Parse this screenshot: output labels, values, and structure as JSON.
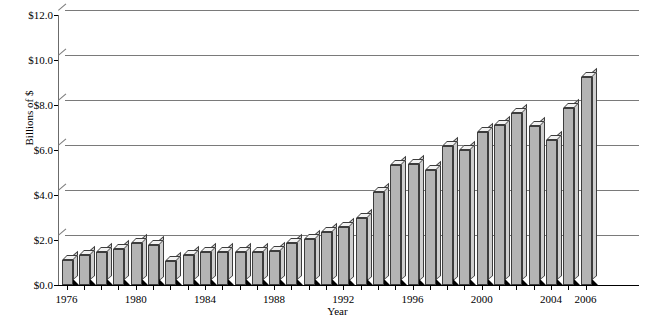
{
  "chart_data": {
    "type": "bar",
    "title": "",
    "xlabel": "Year",
    "ylabel": "Billions of $",
    "ylim": [
      0.0,
      12.0
    ],
    "ytick_step": 2.0,
    "ytick_labels": [
      "$0.0",
      "$2.0",
      "$4.0",
      "$6.0",
      "$8.0",
      "$10.0",
      "$12.0"
    ],
    "ytick_values": [
      0.0,
      2.0,
      4.0,
      6.0,
      8.0,
      10.0,
      12.0
    ],
    "grid": "horizontal",
    "legend": "none",
    "xtick_labels_shown": [
      "1976",
      "1980",
      "1984",
      "1988",
      "1992",
      "1996",
      "2000",
      "2004",
      "2006"
    ],
    "categories": [
      "1976",
      "1977",
      "1978",
      "1979",
      "1980",
      "1981",
      "1982",
      "1983",
      "1984",
      "1985",
      "1986",
      "1987",
      "1988",
      "1989",
      "1990",
      "1991",
      "1992",
      "1993",
      "1994",
      "1995",
      "1996",
      "1997",
      "1998",
      "1999",
      "2000",
      "2001",
      "2002",
      "2003",
      "2004",
      "2005",
      "2006"
    ],
    "values": [
      1.1,
      1.35,
      1.45,
      1.6,
      1.85,
      1.8,
      1.05,
      1.35,
      1.45,
      1.45,
      1.45,
      1.45,
      1.5,
      1.85,
      2.05,
      2.35,
      2.6,
      3.0,
      4.15,
      5.35,
      5.4,
      5.1,
      6.2,
      6.0,
      6.8,
      7.1,
      7.65,
      7.05,
      6.45,
      7.85,
      9.25
    ]
  }
}
